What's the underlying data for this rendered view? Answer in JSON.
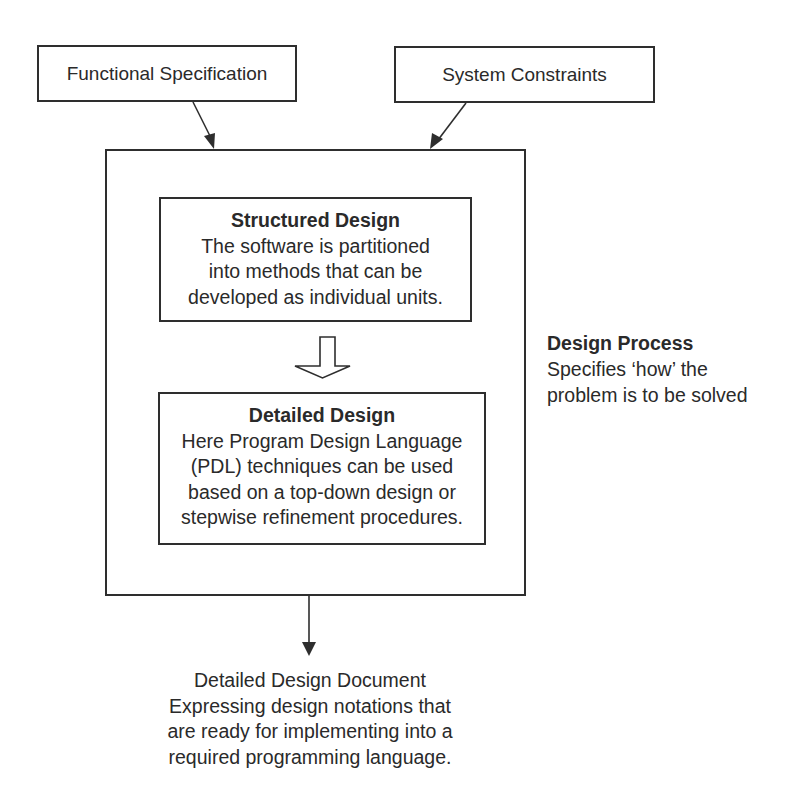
{
  "diagram": {
    "inputs": [
      {
        "id": "functional-specification",
        "label": "Functional Specification"
      },
      {
        "id": "system-constraints",
        "label": "System Constraints"
      }
    ],
    "process": {
      "label": {
        "title": "Design Process",
        "lines": [
          "Specifies ‘how’ the",
          "problem is to be solved"
        ]
      },
      "steps": [
        {
          "id": "structured-design",
          "title": "Structured Design",
          "lines": [
            "The software is partitioned",
            "into methods that can be",
            "developed as individual units."
          ]
        },
        {
          "id": "detailed-design",
          "title": "Detailed Design",
          "lines": [
            "Here Program Design Language",
            "(PDL) techniques can be used",
            "based on a top-down design or",
            "stepwise refinement procedures."
          ]
        }
      ]
    },
    "output": {
      "lines": [
        "Detailed Design Document",
        "Expressing design notations that",
        "are ready for implementing into a",
        "required programming language."
      ]
    },
    "edges": [
      {
        "from": "functional-specification",
        "to": "design-process",
        "style": "solid-arrow"
      },
      {
        "from": "system-constraints",
        "to": "design-process",
        "style": "solid-arrow"
      },
      {
        "from": "structured-design",
        "to": "detailed-design",
        "style": "hollow-block-arrow"
      },
      {
        "from": "design-process",
        "to": "detailed-design-document",
        "style": "solid-arrow"
      }
    ],
    "colors": {
      "stroke": "#2e2e2e",
      "text": "#2a2a2a",
      "background": "#ffffff"
    }
  }
}
